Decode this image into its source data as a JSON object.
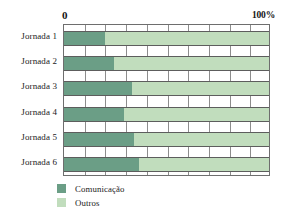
{
  "chart_data": {
    "type": "bar",
    "orientation": "horizontal",
    "stacked": true,
    "title": "",
    "xlabel": "",
    "ylabel": "",
    "xlim": [
      0,
      100
    ],
    "axis_min_label": "0",
    "axis_max_label": "100%",
    "grid": true,
    "grid_step": 10,
    "legend_position": "bottom-left",
    "categories": [
      "Jornada 1",
      "Jornada 2",
      "Jornada 3",
      "Jornada 4",
      "Jornada 5",
      "Jornada 6"
    ],
    "series": [
      {
        "name": "Comunicação",
        "color": "#6b9e86",
        "values": [
          20,
          24,
          33,
          29,
          34,
          36
        ]
      },
      {
        "name": "Outros",
        "color": "#c1ddbd",
        "values": [
          80,
          76,
          67,
          71,
          66,
          64
        ]
      }
    ]
  },
  "legend": {
    "items": [
      {
        "label": "Comunicação",
        "color": "#6b9e86"
      },
      {
        "label": "Outros",
        "color": "#c1ddbd"
      }
    ]
  },
  "colors": {
    "comunicacao": "#6b9e86",
    "outros": "#c1ddbd",
    "gridline": "#8d8d8d",
    "axis": "#6e6e6e",
    "text": "#1b1b1b",
    "background": "#ffffff"
  }
}
